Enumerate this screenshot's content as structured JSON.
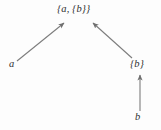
{
  "diagram": {
    "type": "membership-arrow-diagram",
    "width": 161,
    "height": 130,
    "background_color": "#fdfdfd",
    "edge_color": "#7d7d7d",
    "label_color": "#2f2f2f",
    "nodes": [
      {
        "id": "top",
        "label": "{a, {b}}",
        "x": 78,
        "y": 10
      },
      {
        "id": "left",
        "label": "a",
        "x": 13,
        "y": 65
      },
      {
        "id": "right",
        "label": "{b}",
        "x": 138,
        "y": 65
      },
      {
        "id": "bottom",
        "label": "b",
        "x": 139,
        "y": 118
      }
    ],
    "edges": [
      {
        "id": "a-to-set",
        "from": "left",
        "to": "top",
        "style": "arrow",
        "direction": "up-right"
      },
      {
        "id": "setb-to-set",
        "from": "right",
        "to": "top",
        "style": "arrow",
        "direction": "up-left"
      },
      {
        "id": "b-to-setb",
        "from": "bottom",
        "to": "right",
        "style": "arrow",
        "direction": "up"
      }
    ]
  }
}
